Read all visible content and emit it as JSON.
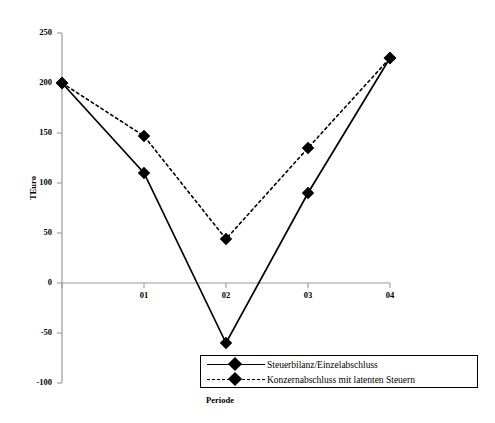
{
  "chart_data": {
    "type": "line",
    "title": "",
    "xlabel": "Periode",
    "ylabel": "TEuro",
    "categories": [
      "",
      "01",
      "02",
      "03",
      "04"
    ],
    "x_tick_labels": [
      "01",
      "02",
      "03",
      "04"
    ],
    "y_tick_labels": [
      "250",
      "200",
      "150",
      "100",
      "50",
      "0",
      "-50",
      "-100"
    ],
    "ylim": [
      -100,
      250
    ],
    "y_step": 50,
    "grid": false,
    "legend_position": "bottom-right",
    "series": [
      {
        "name": "Steuerbilanz/Einzelabschluss",
        "style": "solid",
        "marker": "diamond",
        "color": "#000000",
        "values": [
          200,
          110,
          -60,
          90,
          225
        ]
      },
      {
        "name": "Konzernabschluss mit latenten Steuern",
        "style": "dotted",
        "marker": "diamond",
        "color": "#000000",
        "values": [
          200,
          147,
          44,
          135,
          225
        ]
      }
    ]
  },
  "axes": {
    "y_title": "TEuro",
    "x_title": "Periode",
    "y_ticks": [
      {
        "label": "250",
        "value": 250
      },
      {
        "label": "200",
        "value": 200
      },
      {
        "label": "150",
        "value": 150
      },
      {
        "label": "100",
        "value": 100
      },
      {
        "label": "50",
        "value": 50
      },
      {
        "label": "0",
        "value": 0
      },
      {
        "label": "-50",
        "value": -50
      },
      {
        "label": "-100",
        "value": -100
      }
    ],
    "x_ticks": [
      {
        "label": "01"
      },
      {
        "label": "02"
      },
      {
        "label": "03"
      },
      {
        "label": "04"
      }
    ]
  },
  "legend": {
    "entries": [
      {
        "label": "Steuerbilanz/Einzelabschluss",
        "style": "solid"
      },
      {
        "label": "Konzernabschluss mit latenten Steuern",
        "style": "dotted"
      }
    ]
  }
}
